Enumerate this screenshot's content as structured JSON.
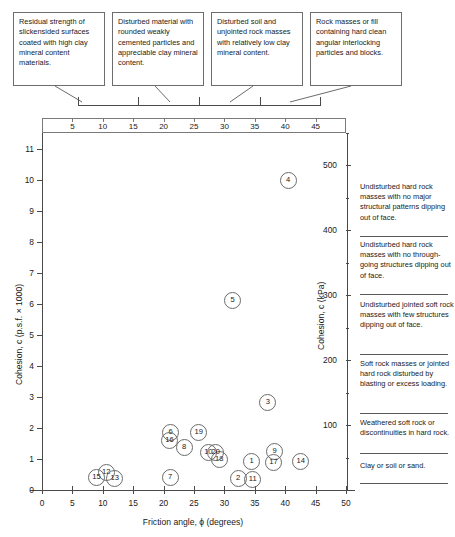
{
  "figure": {
    "title": "",
    "description_boxes": [
      {
        "text": "Residual strength of slickensided surfaces coated with high clay mineral content materials."
      },
      {
        "text": "Disturbed material with rounded weakly cemented particles and appreciable clay mineral content."
      },
      {
        "text": "Disturbed soil and unjointed rock masses with relatively low clay mineral content."
      },
      {
        "text": "Rock masses or fill containing hard clean angular interlocking particles and blocks."
      }
    ],
    "top_scale": {
      "ticks": [
        5,
        10,
        15,
        20,
        25,
        30,
        35,
        40,
        45
      ]
    },
    "legend_blocks": [
      {
        "text": "Undisturbed hard rock masses with no major structural patterns dipping out of face."
      },
      {
        "text": "Undisturbed hard rock masses with no through-going structures dipping out of face."
      },
      {
        "text": "Undisturbed jointed soft rock masses with few structures dipping out of face."
      },
      {
        "text": "Soft rock masses or jointed hard rock disturbed by blasting or excess loading."
      },
      {
        "text": "Weathered soft rock or discontinuities in hard rock."
      },
      {
        "text": "Clay or soil or sand."
      }
    ]
  },
  "chart_data": {
    "type": "scatter",
    "title": "",
    "xlabel": "Friction angle, ϕ (degrees)",
    "ylabel": "Cohesion, c (p.s.f. × 1000)",
    "y2label": "Cohesion, c (kPa)",
    "xlim": [
      0,
      50
    ],
    "ylim": [
      0,
      11.5
    ],
    "y2lim": [
      0,
      550
    ],
    "xticks": [
      0,
      5,
      10,
      15,
      20,
      25,
      30,
      35,
      40,
      45,
      50
    ],
    "yticks": [
      0,
      1,
      2,
      3,
      4,
      5,
      6,
      7,
      8,
      9,
      10,
      11
    ],
    "y2ticks": [
      100,
      200,
      300,
      400,
      500
    ],
    "grid": false,
    "legend": "none",
    "marker": "numbered-circle",
    "points": [
      {
        "label": "1",
        "x": 34.3,
        "y": 0.95
      },
      {
        "label": "2",
        "x": 32.1,
        "y": 0.4
      },
      {
        "label": "3",
        "x": 37.0,
        "y": 2.85
      },
      {
        "label": "4",
        "x": 40.3,
        "y": 10.0
      },
      {
        "label": "5",
        "x": 31.2,
        "y": 6.15
      },
      {
        "label": "6",
        "x": 21.0,
        "y": 1.9
      },
      {
        "label": "7",
        "x": 20.9,
        "y": 0.42
      },
      {
        "label": "8",
        "x": 23.2,
        "y": 1.4
      },
      {
        "label": "9",
        "x": 38.1,
        "y": 1.27
      },
      {
        "label": "10",
        "x": 27.2,
        "y": 1.23
      },
      {
        "label": "11",
        "x": 34.5,
        "y": 0.38
      },
      {
        "label": "12",
        "x": 10.4,
        "y": 0.6
      },
      {
        "label": "13",
        "x": 11.8,
        "y": 0.4
      },
      {
        "label": "14",
        "x": 42.4,
        "y": 0.95
      },
      {
        "label": "15",
        "x": 8.8,
        "y": 0.42
      },
      {
        "label": "16",
        "x": 20.8,
        "y": 1.62
      },
      {
        "label": "17",
        "x": 37.9,
        "y": 0.93
      },
      {
        "label": "18",
        "x": 29.0,
        "y": 1.02
      },
      {
        "label": "19",
        "x": 25.6,
        "y": 1.9
      },
      {
        "label": "20",
        "x": 28.4,
        "y": 1.24
      }
    ]
  }
}
